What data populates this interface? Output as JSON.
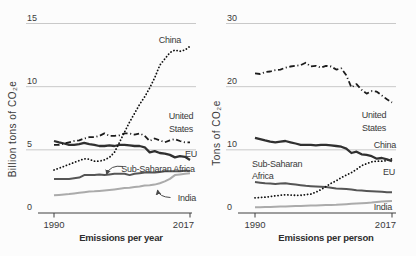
{
  "style": {
    "background": "#fcfcfc",
    "grid_color": "#c9c9c9",
    "axis_color": "#3f3f3f",
    "text_color": "#3a3a3a",
    "title_color": "#2e2e2e",
    "arrow_color": "#4a4a4a"
  },
  "chart_data": [
    {
      "type": "line",
      "title": "Emissions per year",
      "ylabel": "Billion tons of CO₂e",
      "xlabel": "",
      "xlim": [
        1990,
        2017
      ],
      "ylim": [
        0,
        15
      ],
      "yticks": [
        0,
        5,
        10,
        15
      ],
      "xticks": [
        "1990",
        "2017"
      ],
      "grid": true,
      "legend_position": "inline-labels",
      "x": [
        1990,
        1991,
        1992,
        1993,
        1994,
        1995,
        1996,
        1997,
        1998,
        1999,
        2000,
        2001,
        2002,
        2003,
        2004,
        2005,
        2006,
        2007,
        2008,
        2009,
        2010,
        2011,
        2012,
        2013,
        2014,
        2015,
        2016,
        2017
      ],
      "series": [
        {
          "name": "China",
          "style": "dotted",
          "color": "#0f0f0f",
          "width": 1.8,
          "values": [
            3.4,
            3.55,
            3.7,
            3.85,
            4.0,
            4.15,
            4.3,
            4.25,
            4.1,
            4.1,
            4.2,
            4.4,
            4.8,
            5.6,
            6.4,
            7.2,
            7.9,
            8.6,
            9.2,
            9.9,
            10.7,
            11.7,
            12.2,
            12.7,
            12.9,
            12.8,
            12.9,
            13.2
          ]
        },
        {
          "name": "United States",
          "style": "dashdot",
          "color": "#1c1c1c",
          "width": 1.8,
          "values": [
            5.4,
            5.4,
            5.5,
            5.6,
            5.7,
            5.75,
            5.9,
            6.0,
            6.0,
            6.1,
            6.3,
            6.1,
            6.1,
            6.15,
            6.3,
            6.3,
            6.2,
            6.3,
            6.1,
            5.7,
            5.9,
            5.75,
            5.6,
            5.75,
            5.85,
            5.7,
            5.6,
            5.6
          ]
        },
        {
          "name": "EU",
          "style": "solid",
          "color": "#303030",
          "width": 2.3,
          "values": [
            5.7,
            5.6,
            5.5,
            5.4,
            5.4,
            5.45,
            5.55,
            5.45,
            5.4,
            5.3,
            5.3,
            5.35,
            5.3,
            5.4,
            5.4,
            5.35,
            5.3,
            5.3,
            5.2,
            4.8,
            4.9,
            4.75,
            4.7,
            4.6,
            4.4,
            4.5,
            4.45,
            4.2
          ]
        },
        {
          "name": "Sub-Saharan Africa",
          "style": "solid",
          "color": "#555555",
          "width": 2,
          "values": [
            2.7,
            2.7,
            2.7,
            2.7,
            2.75,
            2.8,
            3.0,
            3.0,
            3.0,
            3.05,
            3.0,
            3.05,
            3.1,
            3.1,
            3.1,
            3.0,
            3.1,
            3.15,
            3.2,
            3.2,
            3.2,
            3.25,
            3.3,
            3.3,
            3.3,
            3.3,
            3.35,
            3.35
          ]
        },
        {
          "name": "India",
          "style": "solid",
          "color": "#ababab",
          "width": 2,
          "values": [
            1.4,
            1.43,
            1.47,
            1.5,
            1.55,
            1.6,
            1.65,
            1.7,
            1.72,
            1.75,
            1.78,
            1.82,
            1.87,
            1.92,
            1.97,
            2.0,
            2.05,
            2.1,
            2.18,
            2.2,
            2.25,
            2.35,
            2.5,
            2.7,
            3.0,
            3.05,
            3.1,
            3.15
          ]
        }
      ],
      "labels": [
        {
          "text": "China",
          "px": 170,
          "py": 43,
          "anchor": "middle"
        },
        {
          "text": "United",
          "px": 181,
          "py": 119,
          "anchor": "middle"
        },
        {
          "text": "States",
          "px": 181,
          "py": 132,
          "anchor": "middle"
        },
        {
          "text": "EU",
          "px": 191,
          "py": 157,
          "anchor": "middle"
        },
        {
          "text": "Sub-Saharan Africa",
          "px": 158,
          "py": 172,
          "anchor": "middle"
        },
        {
          "text": "India",
          "px": 187,
          "py": 201,
          "anchor": "middle"
        }
      ],
      "arrows": [
        {
          "from": [
            123,
            166.5
          ],
          "ctrl": [
            110,
            164.5
          ],
          "to": [
            106.5,
            174.5
          ]
        },
        {
          "from": [
            170.5,
            197.5
          ],
          "ctrl": [
            159,
            197
          ],
          "to": [
            157.5,
            190
          ]
        }
      ]
    },
    {
      "type": "line",
      "title": "Emissions per person",
      "ylabel": "Tons of CO₂e",
      "xlabel": "",
      "xlim": [
        1990,
        2017
      ],
      "ylim": [
        0,
        30
      ],
      "yticks": [
        0,
        10,
        20,
        30
      ],
      "xticks": [
        "1990",
        "2017"
      ],
      "grid": true,
      "legend_position": "inline-labels",
      "x": [
        1990,
        1991,
        1992,
        1993,
        1994,
        1995,
        1996,
        1997,
        1998,
        1999,
        2000,
        2001,
        2002,
        2003,
        2004,
        2005,
        2006,
        2007,
        2008,
        2009,
        2010,
        2011,
        2012,
        2013,
        2014,
        2015,
        2016,
        2017
      ],
      "series": [
        {
          "name": "United States",
          "style": "dashdot",
          "color": "#1c1c1c",
          "width": 1.8,
          "values": [
            22.1,
            22.0,
            22.3,
            22.4,
            22.6,
            22.7,
            23.0,
            23.2,
            23.3,
            23.4,
            23.8,
            23.2,
            23.3,
            23.0,
            23.3,
            23.2,
            22.7,
            22.9,
            21.8,
            19.9,
            20.4,
            19.5,
            18.9,
            19.3,
            19.2,
            18.6,
            18.0,
            17.5
          ]
        },
        {
          "name": "EU",
          "style": "solid",
          "color": "#303030",
          "width": 2.3,
          "values": [
            11.9,
            11.7,
            11.5,
            11.3,
            11.2,
            11.3,
            11.4,
            11.2,
            11.0,
            10.8,
            10.8,
            10.8,
            10.7,
            10.8,
            10.8,
            10.7,
            10.6,
            10.5,
            10.2,
            9.5,
            9.7,
            9.3,
            9.2,
            9.0,
            8.6,
            8.7,
            8.5,
            8.2
          ]
        },
        {
          "name": "China",
          "style": "dotted",
          "color": "#0f0f0f",
          "width": 1.8,
          "values": [
            2.4,
            2.45,
            2.5,
            2.6,
            2.7,
            2.8,
            2.9,
            2.85,
            2.8,
            2.8,
            2.9,
            3.0,
            3.3,
            3.7,
            4.2,
            4.7,
            5.1,
            5.6,
            6.0,
            6.4,
            6.9,
            7.5,
            7.8,
            8.1,
            8.2,
            8.2,
            8.3,
            8.6
          ]
        },
        {
          "name": "Sub-Saharan Africa",
          "style": "solid",
          "color": "#555555",
          "width": 2,
          "values": [
            4.9,
            4.8,
            4.7,
            4.65,
            4.6,
            4.65,
            4.7,
            4.6,
            4.5,
            4.4,
            4.3,
            4.25,
            4.2,
            4.15,
            4.1,
            4.0,
            3.9,
            3.85,
            3.8,
            3.7,
            3.6,
            3.55,
            3.5,
            3.45,
            3.4,
            3.35,
            3.3,
            3.3
          ]
        },
        {
          "name": "India",
          "style": "solid",
          "color": "#ababab",
          "width": 2,
          "values": [
            0.9,
            0.92,
            0.95,
            0.97,
            1.0,
            1.02,
            1.05,
            1.07,
            1.1,
            1.12,
            1.15,
            1.17,
            1.2,
            1.22,
            1.25,
            1.28,
            1.3,
            1.35,
            1.4,
            1.45,
            1.5,
            1.55,
            1.6,
            1.65,
            1.75,
            1.8,
            1.85,
            1.9
          ]
        }
      ],
      "labels": [
        {
          "text": "United",
          "px": 374,
          "py": 118,
          "anchor": "middle"
        },
        {
          "text": "States",
          "px": 374,
          "py": 131,
          "anchor": "middle"
        },
        {
          "text": "China",
          "px": 385,
          "py": 148,
          "anchor": "middle"
        },
        {
          "text": "EU",
          "px": 389,
          "py": 175,
          "anchor": "middle"
        },
        {
          "text": "Sub-Saharan",
          "px": 252,
          "py": 167,
          "anchor": "start"
        },
        {
          "text": "Africa",
          "px": 252,
          "py": 179,
          "anchor": "start"
        },
        {
          "text": "India",
          "px": 383,
          "py": 210,
          "anchor": "middle"
        }
      ],
      "arrows": []
    }
  ]
}
